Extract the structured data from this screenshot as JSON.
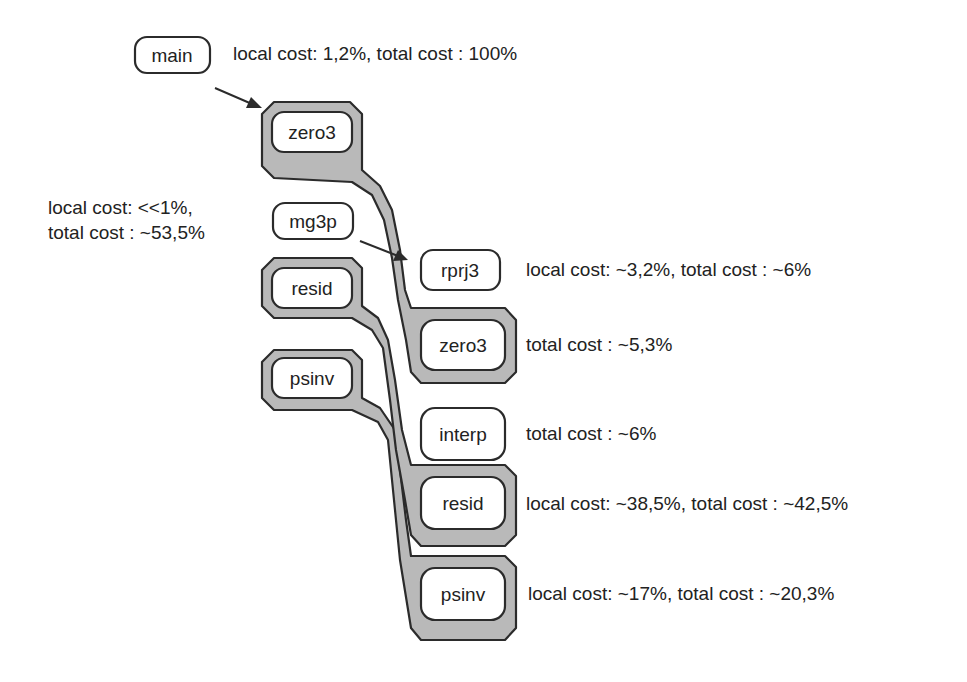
{
  "diagram": {
    "type": "call-graph",
    "nodes": [
      {
        "id": "main",
        "label": "main",
        "grouped": false
      },
      {
        "id": "zero3_a",
        "label": "zero3",
        "grouped": true
      },
      {
        "id": "mg3p",
        "label": "mg3p",
        "grouped": false
      },
      {
        "id": "resid_a",
        "label": "resid",
        "grouped": true
      },
      {
        "id": "psinv_a",
        "label": "psinv",
        "grouped": true
      },
      {
        "id": "rprj3",
        "label": "rprj3",
        "grouped": false
      },
      {
        "id": "zero3_b",
        "label": "zero3",
        "grouped": true
      },
      {
        "id": "interp",
        "label": "interp",
        "grouped": false
      },
      {
        "id": "resid_b",
        "label": "resid",
        "grouped": true
      },
      {
        "id": "psinv_b",
        "label": "psinv",
        "grouped": true
      }
    ],
    "edges": [
      {
        "from": "main",
        "to": "zero3_a",
        "kind": "arrow"
      },
      {
        "from": "mg3p",
        "to": "rprj3",
        "kind": "arrow"
      },
      {
        "from": "zero3_a",
        "to": "zero3_b",
        "kind": "merge-band"
      },
      {
        "from": "resid_a",
        "to": "resid_b",
        "kind": "merge-band"
      },
      {
        "from": "psinv_a",
        "to": "psinv_b",
        "kind": "merge-band"
      }
    ],
    "annotations": {
      "main": "local cost: 1,2%, total cost : 100%",
      "mg3p_line1": "local cost: <<1%,",
      "mg3p_line2": "total cost : ~53,5%",
      "rprj3": "local cost: ~3,2%, total cost : ~6%",
      "zero3_b": "total cost : ~5,3%",
      "interp": "total cost : ~6%",
      "resid_b": "local cost: ~38,5%, total cost : ~42,5%",
      "psinv_b": "local cost: ~17%, total cost : ~20,3%"
    },
    "colors": {
      "hull_fill": "#b9b9b9",
      "stroke": "#2b2b2b",
      "background": "#ffffff"
    }
  }
}
